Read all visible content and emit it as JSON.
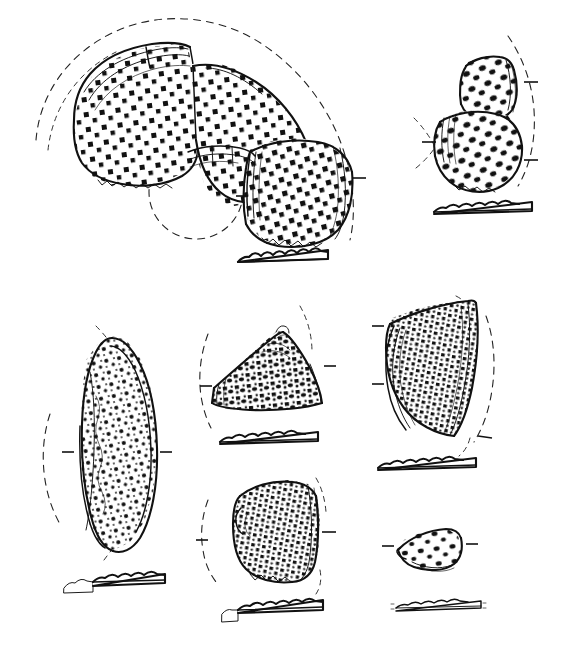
{
  "plate": {
    "title": "Pottery Sherd Illustration Plate",
    "description": "Line-drawn archaeological plate of eight impressed/stamped pottery sherds with accompanying rim-profile sections",
    "medium": "ink line drawing, scanned",
    "background_color": "#ffffff",
    "ink_color": "#111111",
    "width": 577,
    "height": 650
  },
  "legend": {
    "solid_line": "sherd outline and break edges",
    "dashed_arc": "reconstructed vessel circumference / radius arc",
    "tick_mark": "orientation / diameter indicator",
    "dot_grid": "impressed square-stamp decoration",
    "profile_bar": "sectional rim profile with wavy upper edge"
  },
  "figures": [
    {
      "id": "fig-1",
      "label": "large composite rim sherd group",
      "position": "top-left",
      "decoration": "regular grid of impressed squares",
      "has_dashed_arc": true,
      "has_reconstruction_circle": true,
      "has_profile": true,
      "fragment_count": 4
    },
    {
      "id": "fig-2",
      "label": "angular two-part sherd",
      "position": "top-right",
      "decoration": "coarse impressed ovals in diagonal rows",
      "has_dashed_arc": true,
      "has_reconstruction_circle": false,
      "has_profile": true,
      "fragment_count": 2
    },
    {
      "id": "fig-3",
      "label": "elongate lens-shaped body sherd",
      "position": "mid-left",
      "decoration": "dense stippled impressions",
      "has_dashed_arc": true,
      "has_reconstruction_circle": false,
      "has_profile": true,
      "fragment_count": 1
    },
    {
      "id": "fig-4",
      "label": "triangular peaked rim sherd",
      "position": "mid-centre",
      "decoration": "impressed squares in vertical columns",
      "has_dashed_arc": true,
      "has_reconstruction_circle": false,
      "has_profile": true,
      "fragment_count": 1
    },
    {
      "id": "fig-5",
      "label": "flaring fan-shaped rim sherd",
      "position": "mid-right",
      "decoration": "irregular dense impressions",
      "has_dashed_arc": true,
      "has_reconstruction_circle": false,
      "has_profile": true,
      "fragment_count": 1
    },
    {
      "id": "fig-6",
      "label": "squarish body sherd",
      "position": "lower-centre",
      "decoration": "very dense irregular speckled impressions",
      "has_dashed_arc": true,
      "has_reconstruction_circle": false,
      "has_profile": true,
      "fragment_count": 1
    },
    {
      "id": "fig-7",
      "label": "small triangular sherd",
      "position": "lower-right",
      "decoration": "sparse impressed dots",
      "has_dashed_arc": false,
      "has_reconstruction_circle": false,
      "has_profile": true,
      "fragment_count": 1
    }
  ]
}
